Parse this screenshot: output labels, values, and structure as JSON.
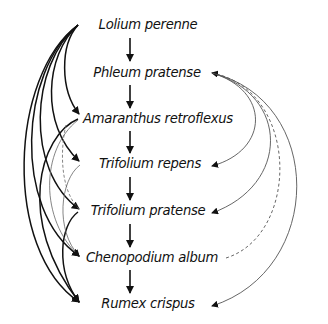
{
  "diagram": {
    "type": "directed-graph",
    "layout": "vertical chain with arc edges on left and right",
    "nodes": [
      {
        "id": "lolium",
        "label": "Lolium perenne"
      },
      {
        "id": "phleum",
        "label": "Phleum pratense"
      },
      {
        "id": "amaranthus",
        "label": "Amaranthus retroflexus"
      },
      {
        "id": "trep",
        "label": "Trifolium repens"
      },
      {
        "id": "tprat",
        "label": "Trifolium pratense"
      },
      {
        "id": "cheno",
        "label": "Chenopodium album"
      },
      {
        "id": "rumex",
        "label": "Rumex crispus"
      }
    ],
    "chain_edges": [
      {
        "from": "lolium",
        "to": "phleum"
      },
      {
        "from": "phleum",
        "to": "amaranthus"
      },
      {
        "from": "amaranthus",
        "to": "trep"
      },
      {
        "from": "trep",
        "to": "tprat"
      },
      {
        "from": "tprat",
        "to": "cheno"
      },
      {
        "from": "cheno",
        "to": "rumex"
      }
    ],
    "left_edges": [
      {
        "from": "lolium",
        "to": "amaranthus",
        "style": "thick"
      },
      {
        "from": "lolium",
        "to": "trep",
        "style": "thick"
      },
      {
        "from": "lolium",
        "to": "tprat",
        "style": "thick"
      },
      {
        "from": "lolium",
        "to": "cheno",
        "style": "thick"
      },
      {
        "from": "lolium",
        "to": "rumex",
        "style": "thick"
      },
      {
        "from": "amaranthus",
        "to": "rumex",
        "style": "thick"
      },
      {
        "from": "tprat",
        "to": "rumex",
        "style": "thick"
      },
      {
        "from": "amaranthus",
        "to": "cheno",
        "style": "thin"
      },
      {
        "from": "trep",
        "to": "cheno",
        "style": "thin"
      },
      {
        "from": "amaranthus",
        "to": "tprat",
        "style": "dashed"
      }
    ],
    "right_edges": [
      {
        "from": "phleum",
        "to": "trep",
        "style": "thin"
      },
      {
        "from": "phleum",
        "to": "tprat",
        "style": "thin"
      },
      {
        "from": "cheno",
        "to": "phleum",
        "style": "dashed"
      },
      {
        "from": "phleum",
        "to": "rumex",
        "style": "thin"
      }
    ],
    "colors": {
      "text": "#111111",
      "thick_edge": "#111111",
      "thin_edge": "#555555",
      "background": "#ffffff"
    }
  }
}
